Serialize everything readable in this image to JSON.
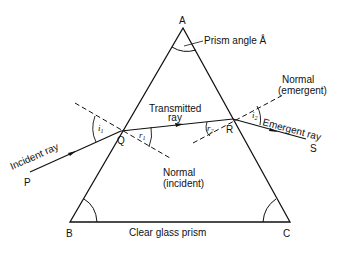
{
  "diagram": {
    "vertices": {
      "apex": "A",
      "bottom_left": "B",
      "bottom_right": "C"
    },
    "points": {
      "incident_start": "P",
      "entry_point": "Q",
      "exit_point": "R",
      "emergent_end": "S"
    },
    "labels": {
      "prism_angle": "Prism angle Å",
      "transmitted_line1": "Transmitted",
      "transmitted_line2": "ray",
      "normal_emergent_line1": "Normal",
      "normal_emergent_line2": "(emergent)",
      "normal_incident_line1": "Normal",
      "normal_incident_line2": "(incident)",
      "incident_ray": "Incident ray",
      "emergent_ray": "Emergent ray",
      "prism_name": "Clear glass prism"
    },
    "angles": {
      "i1": {
        "base": "i",
        "sub": "1"
      },
      "r1": {
        "base": "r",
        "sub": "1"
      },
      "r2": {
        "base": "r",
        "sub": "2"
      },
      "i2": {
        "base": "i",
        "sub": "2"
      }
    },
    "colors": {
      "line": "#111111",
      "background": "#ffffff"
    }
  }
}
